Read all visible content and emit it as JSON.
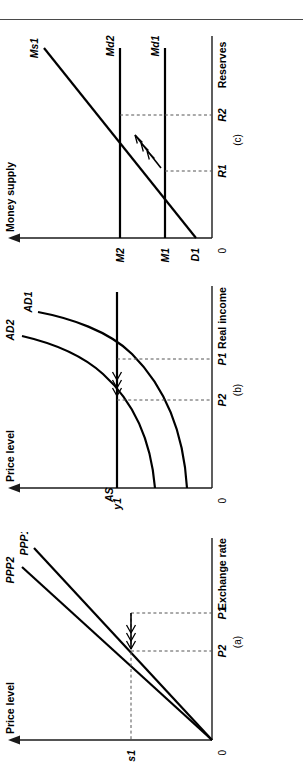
{
  "figure": {
    "orientation": "rotated-90-ccw",
    "panel_count": 3,
    "divider_rule": true
  },
  "panels": [
    {
      "id": "a",
      "caption": "(a)",
      "y_axis_label": "Price level",
      "x_axis_label": "Exchange rate",
      "origin_label": "0",
      "y_ticks": [
        "P1",
        "P2"
      ],
      "x_ticks": [
        "s1"
      ],
      "curves": [
        {
          "name": "PPP1",
          "label": "PPP1",
          "style": "straight-ray"
        },
        {
          "name": "PPP2",
          "label": "PPP2",
          "style": "straight-ray"
        }
      ],
      "arrow": {
        "count": 3,
        "direction": "left",
        "meaning": "shift toward PPP2"
      }
    },
    {
      "id": "b",
      "caption": "(b)",
      "y_axis_label": "Price level",
      "x_axis_label": "Real income",
      "origin_label": "0",
      "y_ticks": [
        "P1",
        "P2"
      ],
      "x_ticks": [
        "y1"
      ],
      "curves": [
        {
          "name": "AS",
          "label": "AS",
          "style": "vertical-supply"
        },
        {
          "name": "AD1",
          "label": "AD1",
          "style": "convex-demand"
        },
        {
          "name": "AD2",
          "label": "AD2",
          "style": "convex-demand"
        }
      ],
      "arrow": {
        "count": 3,
        "direction": "left",
        "meaning": "shift from AD1 to AD2"
      }
    },
    {
      "id": "c",
      "caption": "(c)",
      "y_axis_label": "Money supply",
      "x_axis_label": "Reserves",
      "origin_label": "0",
      "y_ticks": [
        "D1",
        "M1",
        "M2"
      ],
      "x_ticks": [
        "R1",
        "R2"
      ],
      "curves": [
        {
          "name": "Ms1",
          "label": "Ms1",
          "style": "upward-sloping"
        },
        {
          "name": "Md1",
          "label": "Md1",
          "style": "horizontal-demand"
        },
        {
          "name": "Md2",
          "label": "Md2",
          "style": "horizontal-demand"
        }
      ],
      "arrow": {
        "count": 3,
        "direction": "up-right",
        "meaning": "movement from Md1 to Md2"
      }
    }
  ],
  "colors": {
    "ink": "#000000",
    "axis": "#1a1a1a",
    "dashed": "#555555",
    "rule": "#4a4a4a",
    "background": "#ffffff"
  }
}
